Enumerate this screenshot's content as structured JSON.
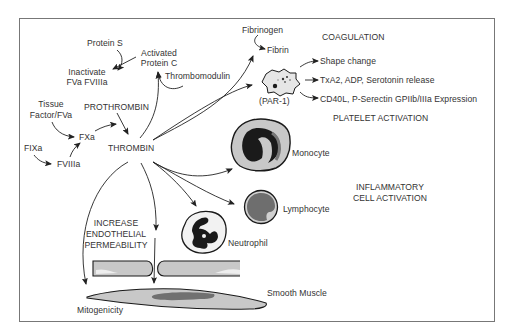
{
  "diagram": {
    "colors": {
      "frame": "#777777",
      "text": "#333333",
      "arrow": "#222222",
      "cell_fill": "#c8c8c8",
      "cell_outline": "#1a1a1a",
      "nucleus_dark": "#1a1a1a",
      "nucleus_grey": "#777777"
    },
    "coagulation": {
      "protein_s": "Protein S",
      "activated_protein_c_line1": "Activated",
      "activated_protein_c_line2": "Protein C",
      "inactivate_line1": "Inactivate",
      "inactivate_line2": "FVa FVIIIa",
      "thrombomodulin": "Thrombomodulin",
      "tissue_factor_line1": "Tissue",
      "tissue_factor_line2": "Factor/FVa",
      "prothrombin": "PROTHROMBIN",
      "fxa": "FXa",
      "fixa": "FIXa",
      "fviiia": "FVIIIa",
      "thrombin": "THROMBIN",
      "fibrinogen": "Fibrinogen",
      "fibrin": "Fibrin",
      "section_heading": "COAGULATION"
    },
    "platelet": {
      "receptor": "(PAR-1)",
      "effects": [
        "Shape change",
        "TxA2, ADP, Serotonin release",
        "CD40L, P-Serectin GPIIb/IIIa Expression"
      ],
      "section_heading": "PLATELET ACTIVATION"
    },
    "inflammatory": {
      "cells": [
        "Monocyte",
        "Lymphocyte",
        "Neutrophil"
      ],
      "section_heading_line1": "INFLAMMATORY",
      "section_heading_line2": "CELL ACTIVATION"
    },
    "vascular": {
      "permeability_line1": "INCREASE",
      "permeability_line2": "ENDOTHELIAL",
      "permeability_line3": "PERMEABILITY",
      "smooth_muscle": "Smooth Muscle",
      "mitogenicity": "Mitogenicity"
    }
  }
}
